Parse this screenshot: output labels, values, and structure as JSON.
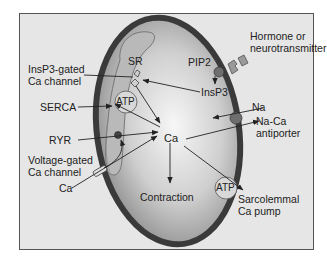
{
  "diagram": {
    "type": "cardiac myocyte calcium handling",
    "colors": {
      "panel_bg": "#e6e6e6",
      "frame_border": "#555555",
      "cell_border": "#3a3a3a",
      "cell_fill_center": "#f7f7f7",
      "cell_fill_edge": "#8a8a8a",
      "sr_fill": "#b9b9b9",
      "protein_fill": "#707070",
      "text": "#222222"
    },
    "labels": {
      "hormone_line1": "Hormone or",
      "hormone_line2": "neurotransmitter",
      "pip2": "PIP2",
      "insp3": "InsP3",
      "insp3_channel_line1": "InsP3-gated",
      "insp3_channel_line2": "Ca channel",
      "sr": "SR",
      "sr_atp": "ATP",
      "serca": "SERCA",
      "ryr": "RYR",
      "vgcc_line1": "Voltage-gated",
      "vgcc_line2": "Ca channel",
      "ca_extracellular": "Ca",
      "ca_center": "Ca",
      "na": "Na",
      "naca_line1": "Na-Ca",
      "naca_line2": "antiporter",
      "contraction": "Contraction",
      "pump_atp": "ATP",
      "pump_line1": "Sarcolemmal",
      "pump_line2": "Ca pump"
    }
  }
}
